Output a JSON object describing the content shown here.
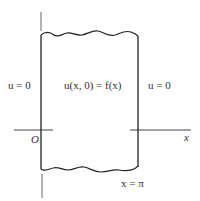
{
  "diagram": {
    "type": "boundary-value-region",
    "labels": {
      "left_boundary": "u = 0",
      "initial_condition": "u(x, 0) = f(x)",
      "right_boundary": "u = 0",
      "origin": "O",
      "x_axis": "x",
      "right_edge": "x = π"
    },
    "colors": {
      "line": "#333333",
      "axis": "#555555",
      "text": "#333333",
      "background": "#ffffff"
    }
  }
}
